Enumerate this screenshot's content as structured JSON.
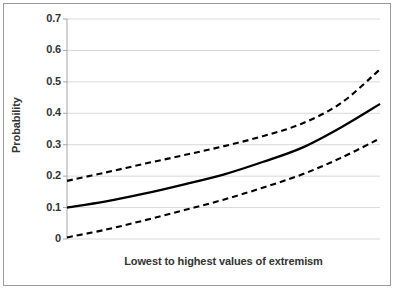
{
  "chart_data": {
    "type": "line",
    "title": "",
    "xlabel": "Lowest to highest values of extremism",
    "ylabel": "Probability",
    "xlim": [
      0,
      1
    ],
    "ylim": [
      0,
      0.7
    ],
    "grid": true,
    "legend": false,
    "y_ticks": [
      "0",
      "0.1",
      "0.2",
      "0.3",
      "0.4",
      "0.5",
      "0.6",
      "0.7"
    ],
    "y_tick_values": [
      0,
      0.1,
      0.2,
      0.3,
      0.4,
      0.5,
      0.6,
      0.7
    ],
    "x_ticks": [],
    "x": [
      0,
      0.125,
      0.25,
      0.375,
      0.5,
      0.625,
      0.75,
      0.875,
      1
    ],
    "series": [
      {
        "name": "Upper confidence bound",
        "style": "dashed",
        "color": "#000000",
        "values": [
          0.185,
          0.212,
          0.24,
          0.267,
          0.295,
          0.327,
          0.367,
          0.432,
          0.54
        ]
      },
      {
        "name": "Predicted probability",
        "style": "solid",
        "color": "#000000",
        "values": [
          0.1,
          0.12,
          0.145,
          0.174,
          0.205,
          0.245,
          0.29,
          0.355,
          0.43
        ]
      },
      {
        "name": "Lower confidence bound",
        "style": "dashed",
        "color": "#000000",
        "values": [
          0.005,
          0.03,
          0.06,
          0.092,
          0.125,
          0.163,
          0.205,
          0.258,
          0.32
        ]
      }
    ]
  },
  "colors": {
    "grid": "#d9d9d9",
    "axis": "#a6a6a6",
    "curve": "#000000",
    "border": "#9a9a9a",
    "text": "#333333",
    "background": "#ffffff"
  }
}
